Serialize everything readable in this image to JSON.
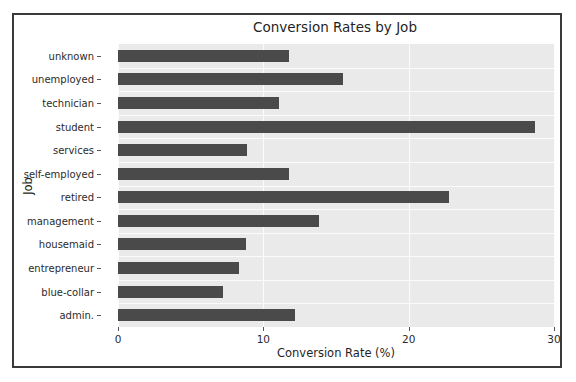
{
  "chart_data": {
    "type": "bar",
    "orientation": "horizontal",
    "title": "Conversion Rates by Job",
    "xlabel": "Conversion Rate (%)",
    "ylabel": "Job",
    "xlim": [
      0,
      30
    ],
    "xticks": [
      0,
      10,
      20,
      30
    ],
    "xtick_labels": [
      "0",
      "10",
      "20",
      "30"
    ],
    "grid": true,
    "legend": null,
    "bar_color": "#4a4a4a",
    "plot_background": "#eaeaea",
    "figure_background": "#ffffff",
    "categories": [
      "unknown",
      "unemployed",
      "technician",
      "student",
      "services",
      "self-employed",
      "retired",
      "management",
      "housemaid",
      "entrepreneur",
      "blue-collar",
      "admin."
    ],
    "values": [
      11.8,
      15.5,
      11.1,
      28.7,
      8.9,
      11.8,
      22.8,
      13.8,
      8.8,
      8.3,
      7.2,
      12.2
    ]
  }
}
